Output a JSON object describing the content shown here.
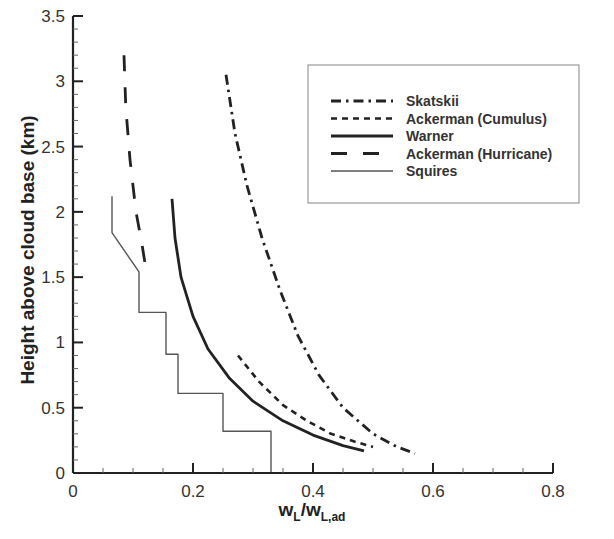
{
  "chart_data": {
    "type": "line",
    "title": "",
    "xlabel": "w_L/w_L,ad",
    "xlabel_parts": {
      "main1": "w",
      "sub1": "L",
      "slash": "/w",
      "sub2": "L,ad"
    },
    "ylabel": "Height above cloud base (km)",
    "xlim": [
      0,
      0.8
    ],
    "ylim": [
      0,
      3.5
    ],
    "x_ticks": [
      "0",
      "0.2",
      "0.4",
      "0.6",
      "0.8"
    ],
    "y_ticks": [
      "0",
      "0.5",
      "1",
      "1.5",
      "2",
      "2.5",
      "3",
      "3.5"
    ],
    "grid": false,
    "legend_position": "upper right",
    "series": [
      {
        "name": "Skatskii",
        "style": "dash-dot",
        "points": [
          [
            0.255,
            3.05
          ],
          [
            0.27,
            2.6
          ],
          [
            0.29,
            2.2
          ],
          [
            0.315,
            1.8
          ],
          [
            0.345,
            1.4
          ],
          [
            0.375,
            1.05
          ],
          [
            0.41,
            0.75
          ],
          [
            0.45,
            0.5
          ],
          [
            0.5,
            0.3
          ],
          [
            0.54,
            0.2
          ],
          [
            0.57,
            0.15
          ]
        ]
      },
      {
        "name": "Ackerman (Cumulus)",
        "style": "dashed",
        "points": [
          [
            0.275,
            0.9
          ],
          [
            0.31,
            0.7
          ],
          [
            0.35,
            0.52
          ],
          [
            0.39,
            0.4
          ],
          [
            0.43,
            0.3
          ],
          [
            0.47,
            0.24
          ],
          [
            0.5,
            0.2
          ]
        ]
      },
      {
        "name": "Warner",
        "style": "solid-thick",
        "points": [
          [
            0.165,
            2.1
          ],
          [
            0.17,
            1.8
          ],
          [
            0.18,
            1.5
          ],
          [
            0.2,
            1.2
          ],
          [
            0.225,
            0.95
          ],
          [
            0.26,
            0.73
          ],
          [
            0.3,
            0.55
          ],
          [
            0.35,
            0.4
          ],
          [
            0.4,
            0.29
          ],
          [
            0.45,
            0.21
          ],
          [
            0.485,
            0.17
          ]
        ]
      },
      {
        "name": "Ackerman (Hurricane)",
        "style": "long-dash",
        "points": [
          [
            0.085,
            3.2
          ],
          [
            0.088,
            2.8
          ],
          [
            0.095,
            2.4
          ],
          [
            0.105,
            2.0
          ],
          [
            0.115,
            1.75
          ],
          [
            0.122,
            1.55
          ]
        ]
      },
      {
        "name": "Squires",
        "style": "solid-thin",
        "points": [
          [
            0.065,
            2.12
          ],
          [
            0.065,
            1.84
          ],
          [
            0.11,
            1.54
          ],
          [
            0.11,
            1.23
          ],
          [
            0.155,
            1.23
          ],
          [
            0.155,
            0.91
          ],
          [
            0.175,
            0.91
          ],
          [
            0.175,
            0.61
          ],
          [
            0.25,
            0.61
          ],
          [
            0.25,
            0.32
          ],
          [
            0.33,
            0.32
          ],
          [
            0.33,
            0.0
          ]
        ]
      }
    ]
  }
}
